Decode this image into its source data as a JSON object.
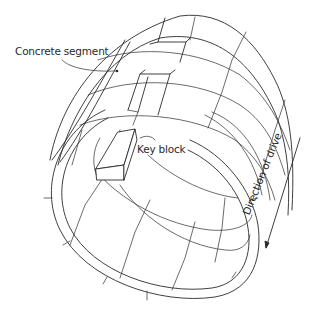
{
  "diagram": {
    "type": "tunnel-lining-illustration",
    "style": "hand-drawn line art",
    "labels": {
      "concrete_segment": "Concrete segment",
      "key_block": "Key block",
      "direction_of_drive": "Direction of drive"
    },
    "components": [
      {
        "name": "cylindrical tunnel lining",
        "description": "ring of segments forming a tube"
      },
      {
        "name": "concrete segment",
        "description": "curved panel of the lining, indicated by leader line with dot"
      },
      {
        "name": "key block",
        "description": "wedge-shaped block shown removed from the top slot of a ring"
      },
      {
        "name": "direction arrow",
        "description": "line with arrowhead along the tube axis"
      }
    ],
    "colors": {
      "line": "#2a2a2a",
      "background": "#ffffff"
    }
  }
}
